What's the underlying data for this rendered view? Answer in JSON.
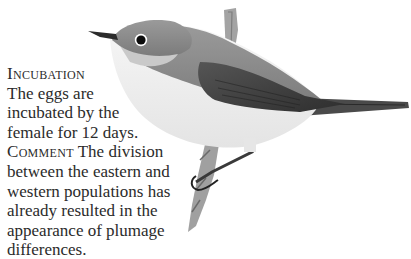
{
  "page": {
    "sections": [
      {
        "heading": "Incubation",
        "lines": [
          "The eggs are",
          "incubated by the",
          "female for 12 days."
        ]
      },
      {
        "heading": "Comment",
        "first_line_rest": " The division",
        "lines": [
          "between the eastern and",
          "western populations has",
          "already resulted in the",
          "appearance of plumage",
          "differences."
        ]
      }
    ],
    "illustration": {
      "subject": "bird perched on branch",
      "colors": {
        "crown": "#8a8a8a",
        "back": "#6e6e6e",
        "wing": "#3e3e3e",
        "underside": "#f2f2f2",
        "branch": "#9a9a9a"
      }
    }
  }
}
